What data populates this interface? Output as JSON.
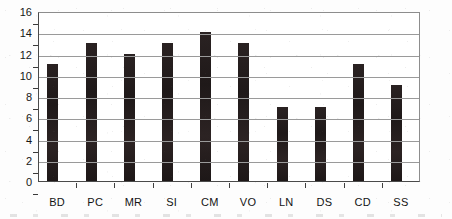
{
  "chart_data": {
    "type": "bar",
    "title": "",
    "subtitle": "",
    "xlabel": "",
    "ylabel": "",
    "categories": [
      "BD",
      "PC",
      "MR",
      "SI",
      "CM",
      "VO",
      "LN",
      "DS",
      "CD",
      "SS"
    ],
    "values": [
      11,
      13,
      12,
      13,
      14,
      13,
      7,
      7,
      11,
      9
    ],
    "ylim": [
      0,
      16
    ],
    "ytick_labels": [
      "0",
      "2",
      "4",
      "6",
      "8",
      "10",
      "12",
      "14",
      "16"
    ],
    "ytick_values": [
      0,
      2,
      4,
      6,
      8,
      10,
      12,
      14,
      16
    ],
    "grid": true,
    "grid_axis": "y",
    "legend": false,
    "legend_position": "none",
    "bar_color": "#241d1d",
    "grid_color": "#9a9a9a",
    "axis_color": "#4a4a4a",
    "background_color": "#ffffff",
    "annotations": []
  }
}
